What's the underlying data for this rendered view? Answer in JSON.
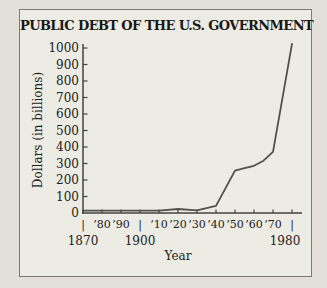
{
  "figure": {
    "title": "PUBLIC DEBT OF THE U.S. GOVERNMENT"
  },
  "y_axis": {
    "label": "Dollars (in billions)",
    "tick_labels": [
      "0",
      "100",
      "200",
      "300",
      "400",
      "500",
      "600",
      "700",
      "800",
      "900",
      "1000"
    ]
  },
  "x_axis": {
    "label": "Year",
    "decade_tick_row": [
      "|",
      "’80",
      "’90",
      "|",
      "’10",
      "’20",
      "’30",
      "’40",
      "’50",
      "’60",
      "’70",
      "|"
    ],
    "century_labels": [
      {
        "text": "1870",
        "year": 1870
      },
      {
        "text": "1900",
        "year": 1900
      },
      {
        "text": "1980",
        "year": 1980
      }
    ]
  },
  "chart_data": {
    "type": "line",
    "title": "PUBLIC DEBT OF THE U.S. GOVERNMENT",
    "xlabel": "Year",
    "ylabel": "Dollars (in billions)",
    "x": [
      1870,
      1880,
      1890,
      1900,
      1910,
      1920,
      1930,
      1940,
      1950,
      1955,
      1960,
      1965,
      1970,
      1980
    ],
    "y": [
      2,
      2,
      1,
      1,
      1,
      24,
      16,
      43,
      257,
      272,
      286,
      317,
      371,
      1025
    ],
    "xlim": [
      1870,
      1980
    ],
    "ylim": [
      0,
      1000
    ],
    "x_tick_interval": 10,
    "y_tick_interval": 100,
    "y_ticks": [
      0,
      100,
      200,
      300,
      400,
      500,
      600,
      700,
      800,
      900,
      1000
    ],
    "grid": false,
    "legend": false
  },
  "colors": {
    "page_bg": "#e2e0d9",
    "frame_bg": "#ecebe4",
    "frame_border": "#7c7a71",
    "axis": "#45433e",
    "line": "#53514c",
    "ink": "#1f1e1a"
  }
}
